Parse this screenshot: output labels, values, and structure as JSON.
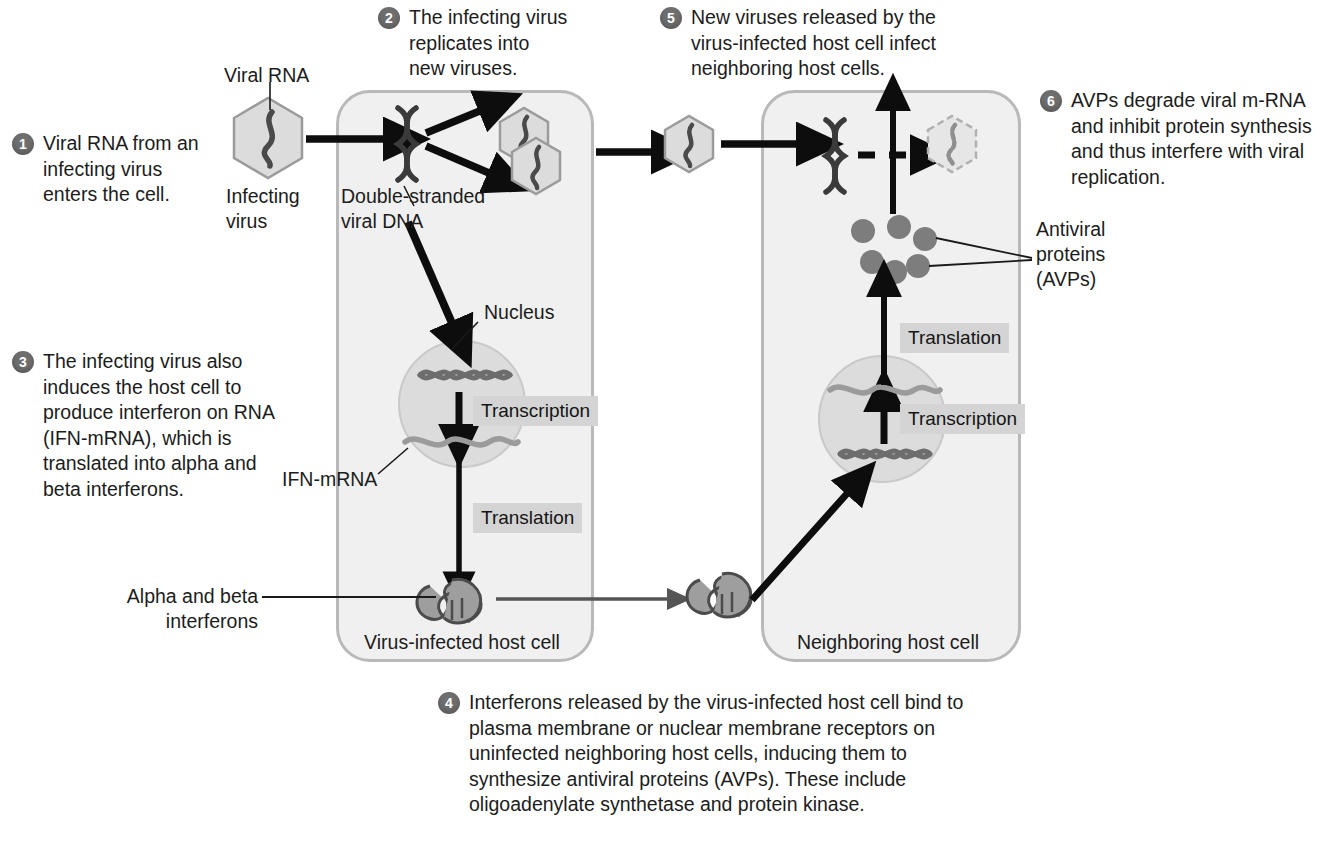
{
  "diagram": {
    "colors": {
      "badge": "#6e6e6e",
      "cell_fill": "#f0f0f0",
      "cell_border": "#b9b9b9",
      "nucleus_fill": "#dcdcdc",
      "virus_fill": "#dcdcdc",
      "protein_gray": "#8a8a8a",
      "tag_bg": "#d4d4d4",
      "arrow_black": "#0d0d0d",
      "arrow_gray": "#555555"
    }
  },
  "steps": [
    {
      "number": "1",
      "text": "Viral RNA from an\ninfecting virus\nenters the cell."
    },
    {
      "number": "2",
      "text": "The infecting virus\nreplicates into\nnew viruses."
    },
    {
      "number": "3",
      "text": "The infecting virus also\ninduces the host cell to\nproduce interferon on RNA\n(IFN-mRNA), which is\ntranslated into alpha and\nbeta interferons."
    },
    {
      "number": "4",
      "text": "Interferons released by the virus-infected host cell bind to\nplasma membrane or nuclear membrane receptors on\nuninfected neighboring host cells, inducing them to\nsynthesize antiviral proteins (AVPs). These include\noligoadenylate synthetase and protein kinase."
    },
    {
      "number": "5",
      "text": "New viruses released by the\nvirus-infected host cell infect\nneighboring host cells."
    },
    {
      "number": "6",
      "text": "AVPs degrade viral m-RNA\nand inhibit protein synthesis\nand thus interfere with viral\nreplication."
    }
  ],
  "labels": {
    "viral_rna": "Viral RNA",
    "infecting_virus": "Infecting\nvirus",
    "double_stranded_dna": "Double-stranded\nviral DNA",
    "nucleus": "Nucleus",
    "ifn_mrna": "IFN-mRNA",
    "alpha_beta_interferons": "Alpha and beta\ninterferons",
    "infected_cell": "Virus-infected host cell",
    "neighboring_cell": "Neighboring host cell",
    "antiviral_proteins": "Antiviral\nproteins\n(AVPs)"
  },
  "process_tags": {
    "transcription_left": "Transcription",
    "translation_left": "Translation",
    "translation_right": "Translation",
    "transcription_right": "Transcription"
  }
}
